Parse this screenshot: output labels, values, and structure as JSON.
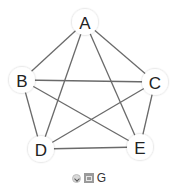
{
  "diagram": {
    "type": "complete-graph",
    "title": "",
    "nodes": [
      {
        "id": "A",
        "label": "A",
        "x": 85,
        "y": 22
      },
      {
        "id": "B",
        "label": "B",
        "x": 22,
        "y": 80
      },
      {
        "id": "C",
        "label": "C",
        "x": 155,
        "y": 82
      },
      {
        "id": "D",
        "label": "D",
        "x": 41,
        "y": 149
      },
      {
        "id": "E",
        "label": "E",
        "x": 140,
        "y": 147
      }
    ],
    "edges": [
      [
        "A",
        "B"
      ],
      [
        "A",
        "C"
      ],
      [
        "A",
        "D"
      ],
      [
        "A",
        "E"
      ],
      [
        "B",
        "C"
      ],
      [
        "B",
        "D"
      ],
      [
        "B",
        "E"
      ],
      [
        "C",
        "D"
      ],
      [
        "C",
        "E"
      ],
      [
        "D",
        "E"
      ]
    ],
    "colors": {
      "edge": "#6a6a6a",
      "node_fill": "#ffffff",
      "label": "#222222"
    }
  },
  "footer": {
    "icons": [
      "expand-icon",
      "image-icon"
    ],
    "label": "G"
  }
}
